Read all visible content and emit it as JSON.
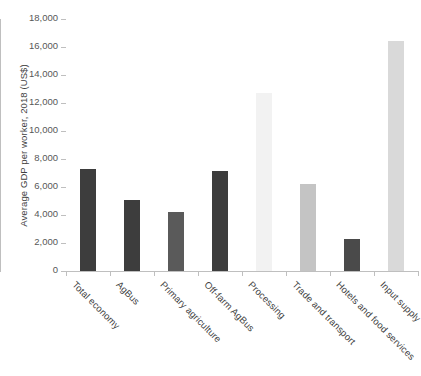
{
  "chart_data": {
    "type": "bar",
    "title": "",
    "xlabel": "",
    "ylabel": "Average GDP per worker, 2018 (US$)",
    "ylim": [
      0,
      18000
    ],
    "ytick_interval": 2000,
    "ytick_labels": [
      "18,000",
      "16,000",
      "14,000",
      "12,000",
      "10,000",
      "8,000",
      "6,000",
      "4,000",
      "2,000",
      "0"
    ],
    "ytick_values": [
      18000,
      16000,
      14000,
      12000,
      10000,
      8000,
      6000,
      4000,
      2000,
      0
    ],
    "grid": false,
    "legend": "none",
    "categories": [
      "Total economy",
      "AgBus",
      "Primary agriculture",
      "Off-farm AgBus",
      "Processing",
      "Trade and transport",
      "Hotels and food services",
      "Input supply"
    ],
    "values": [
      7300,
      5050,
      4250,
      7150,
      12700,
      6200,
      2300,
      16400
    ],
    "bar_colors": [
      "#3d3d3d",
      "#3d3d3d",
      "#5a5a5a",
      "#3d3d3d",
      "#f2f2f2",
      "#c4c4c4",
      "#4a4a4a",
      "#d9d9d9"
    ]
  },
  "axis": {
    "line_color": "#bfbfbf"
  }
}
